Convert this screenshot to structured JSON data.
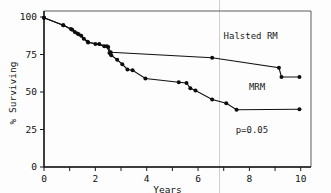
{
  "chart_data": {
    "type": "line",
    "title": "",
    "subtitle": "",
    "xlabel": "Years",
    "ylabel": "% Surviving",
    "xlim": [
      0,
      10.4
    ],
    "ylim": [
      0,
      104
    ],
    "grid": false,
    "legend_position": "inline-annotations",
    "x_ticks": [
      0,
      1,
      2,
      3,
      4,
      5,
      6,
      7,
      8,
      9,
      10
    ],
    "x_tick_labels": [
      "0",
      "",
      "2",
      "",
      "4",
      "",
      "6",
      "",
      "8",
      "",
      "10"
    ],
    "y_ticks": [
      0,
      25,
      50,
      75,
      100
    ],
    "y_tick_labels": [
      "0",
      "25",
      "50",
      "75",
      "100"
    ],
    "annotations": [
      {
        "name": "halsted-label",
        "text": "Halsted RM",
        "x": 8.05,
        "y": 85.5
      },
      {
        "name": "mrm-label",
        "text": "MRM",
        "x": 8.3,
        "y": 51.5
      },
      {
        "name": "pvalue-label",
        "text": "p=0.05",
        "x": 8.1,
        "y": 22.5
      }
    ],
    "series": [
      {
        "name": "Halsted RM",
        "marker": "filled-circle",
        "points": [
          {
            "x": 0.0,
            "y": 99.5
          },
          {
            "x": 0.75,
            "y": 94.5
          },
          {
            "x": 1.1,
            "y": 91.5
          },
          {
            "x": 1.3,
            "y": 89.0
          },
          {
            "x": 1.45,
            "y": 87.5
          },
          {
            "x": 1.7,
            "y": 83.5
          },
          {
            "x": 2.0,
            "y": 82.0
          },
          {
            "x": 2.35,
            "y": 80.5
          },
          {
            "x": 2.5,
            "y": 80.0
          },
          {
            "x": 2.6,
            "y": 76.5
          },
          {
            "x": 6.55,
            "y": 72.8
          },
          {
            "x": 9.15,
            "y": 66.2
          },
          {
            "x": 9.25,
            "y": 60.0
          },
          {
            "x": 9.95,
            "y": 60.0
          }
        ]
      },
      {
        "name": "MRM",
        "marker": "filled-circle",
        "points": [
          {
            "x": 0.0,
            "y": 99.5
          },
          {
            "x": 0.75,
            "y": 94.5
          },
          {
            "x": 1.05,
            "y": 92.0
          },
          {
            "x": 1.2,
            "y": 90.0
          },
          {
            "x": 1.35,
            "y": 88.5
          },
          {
            "x": 1.55,
            "y": 85.5
          },
          {
            "x": 1.72,
            "y": 83.0
          },
          {
            "x": 2.15,
            "y": 82.0
          },
          {
            "x": 2.45,
            "y": 80.5
          },
          {
            "x": 2.55,
            "y": 76.0
          },
          {
            "x": 2.62,
            "y": 74.5
          },
          {
            "x": 2.85,
            "y": 71.5
          },
          {
            "x": 3.05,
            "y": 68.5
          },
          {
            "x": 3.25,
            "y": 65.0
          },
          {
            "x": 3.45,
            "y": 64.5
          },
          {
            "x": 3.95,
            "y": 59.0
          },
          {
            "x": 5.25,
            "y": 56.5
          },
          {
            "x": 5.55,
            "y": 56.0
          },
          {
            "x": 5.7,
            "y": 52.5
          },
          {
            "x": 5.9,
            "y": 51.0
          },
          {
            "x": 6.55,
            "y": 45.0
          },
          {
            "x": 7.1,
            "y": 42.5
          },
          {
            "x": 7.5,
            "y": 38.2
          },
          {
            "x": 9.95,
            "y": 38.5
          }
        ]
      }
    ]
  },
  "figure": {
    "caption": "",
    "background_color": "#fdfdfd",
    "line_color": "#111111",
    "frame_color": "#4a4a4a"
  }
}
